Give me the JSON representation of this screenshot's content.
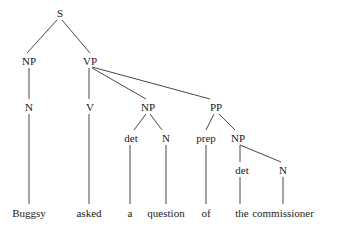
{
  "diagram": {
    "type": "syntax-tree",
    "nodes": [
      {
        "id": "S",
        "label": "S",
        "x": 60,
        "y": 17
      },
      {
        "id": "NP1",
        "label": "NP",
        "x": 29,
        "y": 65
      },
      {
        "id": "VP",
        "label": "VP",
        "x": 90,
        "y": 65
      },
      {
        "id": "N1",
        "label": "N",
        "x": 29,
        "y": 111
      },
      {
        "id": "V",
        "label": "V",
        "x": 90,
        "y": 111
      },
      {
        "id": "NP2",
        "label": "NP",
        "x": 148,
        "y": 111
      },
      {
        "id": "PP",
        "label": "PP",
        "x": 216,
        "y": 111
      },
      {
        "id": "det1",
        "label": "det",
        "x": 131,
        "y": 142
      },
      {
        "id": "N2",
        "label": "N",
        "x": 166,
        "y": 142
      },
      {
        "id": "prep",
        "label": "prep",
        "x": 206,
        "y": 142
      },
      {
        "id": "NP3",
        "label": "NP",
        "x": 238,
        "y": 142
      },
      {
        "id": "det2",
        "label": "det",
        "x": 242,
        "y": 174
      },
      {
        "id": "N3",
        "label": "N",
        "x": 283,
        "y": 174
      },
      {
        "id": "w1",
        "label": "Buggsy",
        "x": 29,
        "y": 217
      },
      {
        "id": "w2",
        "label": "asked",
        "x": 89,
        "y": 217
      },
      {
        "id": "w3",
        "label": "a",
        "x": 130,
        "y": 217
      },
      {
        "id": "w4",
        "label": "question",
        "x": 166,
        "y": 217
      },
      {
        "id": "w5",
        "label": "of",
        "x": 206,
        "y": 217
      },
      {
        "id": "w6",
        "label": "the",
        "x": 242,
        "y": 217
      },
      {
        "id": "w7",
        "label": "commissioner",
        "x": 283,
        "y": 217
      }
    ],
    "edges": [
      {
        "from": "S",
        "to": "NP1",
        "x1": 57,
        "y1": 20,
        "x2": 27,
        "y2": 53
      },
      {
        "from": "S",
        "to": "VP",
        "x1": 62,
        "y1": 20,
        "x2": 90,
        "y2": 53
      },
      {
        "from": "NP1",
        "to": "N1",
        "x1": 29,
        "y1": 68,
        "x2": 29,
        "y2": 99
      },
      {
        "from": "VP",
        "to": "V",
        "x1": 89,
        "y1": 68,
        "x2": 89,
        "y2": 99
      },
      {
        "from": "VP",
        "to": "NP2",
        "x1": 92,
        "y1": 68,
        "x2": 146,
        "y2": 99
      },
      {
        "from": "VP",
        "to": "PP",
        "x1": 92,
        "y1": 67,
        "x2": 210,
        "y2": 99
      },
      {
        "from": "NP2",
        "to": "det1",
        "x1": 146,
        "y1": 114,
        "x2": 134,
        "y2": 130
      },
      {
        "from": "NP2",
        "to": "N2",
        "x1": 150,
        "y1": 114,
        "x2": 162,
        "y2": 130
      },
      {
        "from": "PP",
        "to": "prep",
        "x1": 214,
        "y1": 114,
        "x2": 206,
        "y2": 130
      },
      {
        "from": "PP",
        "to": "NP3",
        "x1": 219,
        "y1": 114,
        "x2": 235,
        "y2": 130
      },
      {
        "from": "NP3",
        "to": "det2",
        "x1": 240,
        "y1": 145,
        "x2": 240,
        "y2": 162
      },
      {
        "from": "NP3",
        "to": "N3",
        "x1": 240,
        "y1": 145,
        "x2": 281,
        "y2": 162
      },
      {
        "from": "N1",
        "to": "w1",
        "x1": 29,
        "y1": 114,
        "x2": 29,
        "y2": 204
      },
      {
        "from": "V",
        "to": "w2",
        "x1": 89,
        "y1": 114,
        "x2": 89,
        "y2": 204
      },
      {
        "from": "det1",
        "to": "w3",
        "x1": 130,
        "y1": 145,
        "x2": 130,
        "y2": 204
      },
      {
        "from": "N2",
        "to": "w4",
        "x1": 166,
        "y1": 145,
        "x2": 166,
        "y2": 204
      },
      {
        "from": "prep",
        "to": "w5",
        "x1": 206,
        "y1": 145,
        "x2": 206,
        "y2": 204
      },
      {
        "from": "det2",
        "to": "w6",
        "x1": 240,
        "y1": 177,
        "x2": 240,
        "y2": 204
      },
      {
        "from": "N3",
        "to": "w7",
        "x1": 283,
        "y1": 177,
        "x2": 283,
        "y2": 204
      }
    ],
    "colors": {
      "line": "#333333",
      "text": "#1a1a1a",
      "background": "#ffffff"
    }
  }
}
